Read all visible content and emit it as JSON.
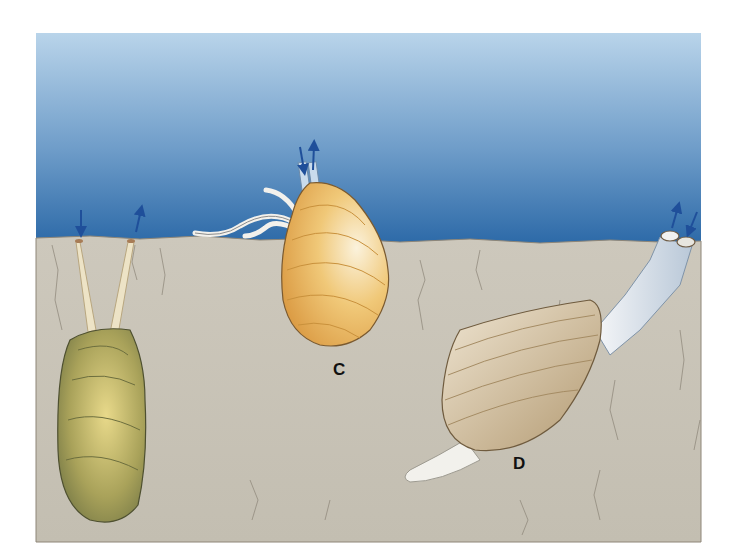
{
  "figure": {
    "frame": {
      "x": 36,
      "y": 33,
      "width": 665,
      "height": 509
    },
    "water": {
      "color_top": "#b9d4ea",
      "color_bottom": "#2d6aa8",
      "surface_y": 237
    },
    "sediment": {
      "color": "#c9c4b8"
    },
    "organisms": [
      {
        "id": "A",
        "name": "green-clam",
        "shell_color": "#8f9258",
        "label": ""
      },
      {
        "id": "C",
        "name": "yellow-clam",
        "shell_color": "#e8b863",
        "label": "C"
      },
      {
        "id": "D",
        "name": "tube-clam",
        "shell_color": "#d8c6a6",
        "label": "D"
      }
    ],
    "flow_arrow_color": "#1f4f9a"
  },
  "labels": {
    "c": "C",
    "d": "D"
  }
}
